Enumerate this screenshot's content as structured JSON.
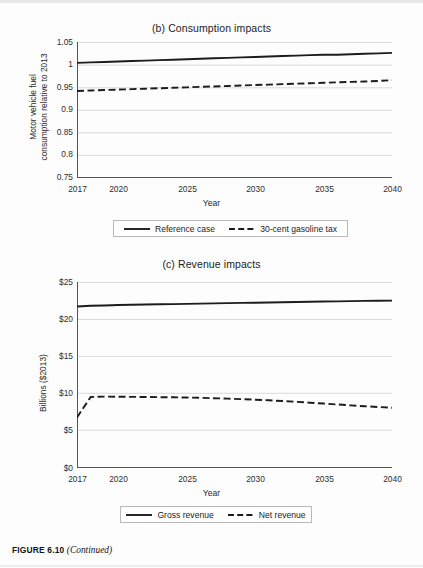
{
  "caption": {
    "figure_number": "FIGURE 6.10",
    "continued": "(Continued)"
  },
  "panel_b": {
    "title": "(b) Consumption impacts",
    "ylabel_line1": "Motor vehicle fuel",
    "ylabel_line2": "consumption relative to 2013",
    "xlabel": "Year",
    "ytick_labels": [
      "1.05",
      "1",
      "0.95",
      "0.9",
      "0.85",
      "0.8",
      "0.75"
    ],
    "xtick_labels": [
      "2017",
      "2020",
      "2025",
      "2030",
      "2035",
      "2040"
    ],
    "legend": [
      {
        "label": "Reference case",
        "style": "solid"
      },
      {
        "label": "30-cent gasoline tax",
        "style": "dashed"
      }
    ]
  },
  "panel_c": {
    "title": "(c) Revenue impacts",
    "ylabel_line1": "Billions ($2013)",
    "xlabel": "Year",
    "ytick_labels": [
      "$25",
      "$20",
      "$15",
      "$10",
      "$5",
      "$0"
    ],
    "xtick_labels": [
      "2017",
      "2020",
      "2025",
      "2030",
      "2035",
      "2040"
    ],
    "legend": [
      {
        "label": "Gross revenue",
        "style": "solid"
      },
      {
        "label": "Net revenue",
        "style": "dashed"
      }
    ]
  },
  "colors": {
    "line": "#1c1c1c",
    "grid": "#d2d2d2",
    "axis": "#4a4a4a",
    "text": "#222222"
  },
  "chart_data": [
    {
      "type": "line",
      "id": "panel-b",
      "title": "(b) Consumption impacts",
      "xlabel": "Year",
      "ylabel": "Motor vehicle fuel consumption relative to 2013",
      "xlim": [
        2017,
        2040
      ],
      "ylim": [
        0.75,
        1.05
      ],
      "yticks": [
        0.75,
        0.8,
        0.85,
        0.9,
        0.95,
        1.0,
        1.05
      ],
      "xticks": [
        2017,
        2020,
        2025,
        2030,
        2035,
        2040
      ],
      "xtick_minor_step": 1,
      "grid": "horizontal",
      "legend_position": "below",
      "x": [
        2017,
        2018,
        2019,
        2020,
        2021,
        2022,
        2023,
        2024,
        2025,
        2026,
        2027,
        2028,
        2029,
        2030,
        2031,
        2032,
        2033,
        2034,
        2035,
        2036,
        2037,
        2038,
        2039,
        2040
      ],
      "series": [
        {
          "name": "Reference case",
          "style": "solid",
          "values": [
            1.004,
            1.005,
            1.006,
            1.007,
            1.008,
            1.009,
            1.01,
            1.011,
            1.012,
            1.013,
            1.014,
            1.015,
            1.016,
            1.017,
            1.018,
            1.019,
            1.02,
            1.021,
            1.022,
            1.022,
            1.023,
            1.024,
            1.025,
            1.026
          ]
        },
        {
          "name": "30-cent gasoline tax",
          "style": "dashed",
          "values": [
            0.942,
            0.943,
            0.944,
            0.945,
            0.946,
            0.947,
            0.948,
            0.949,
            0.95,
            0.951,
            0.952,
            0.953,
            0.954,
            0.955,
            0.956,
            0.957,
            0.958,
            0.959,
            0.96,
            0.961,
            0.962,
            0.963,
            0.964,
            0.966
          ]
        }
      ]
    },
    {
      "type": "line",
      "id": "panel-c",
      "title": "(c) Revenue impacts",
      "xlabel": "Year",
      "ylabel": "Billions ($2013)",
      "xlim": [
        2017,
        2040
      ],
      "ylim": [
        0,
        25
      ],
      "yticks": [
        0,
        5,
        10,
        15,
        20,
        25
      ],
      "xticks": [
        2017,
        2020,
        2025,
        2030,
        2035,
        2040
      ],
      "xtick_minor_step": 1,
      "grid": "horizontal",
      "legend_position": "below",
      "x": [
        2017,
        2018,
        2019,
        2020,
        2021,
        2022,
        2023,
        2024,
        2025,
        2026,
        2027,
        2028,
        2029,
        2030,
        2031,
        2032,
        2033,
        2034,
        2035,
        2036,
        2037,
        2038,
        2039,
        2040
      ],
      "series": [
        {
          "name": "Gross revenue",
          "style": "solid",
          "values": [
            21.7,
            21.8,
            21.85,
            21.9,
            21.95,
            21.98,
            22.0,
            22.03,
            22.06,
            22.1,
            22.13,
            22.16,
            22.19,
            22.22,
            22.25,
            22.28,
            22.31,
            22.34,
            22.37,
            22.4,
            22.43,
            22.46,
            22.48,
            22.5
          ]
        },
        {
          "name": "Net revenue",
          "style": "dashed",
          "values": [
            6.8,
            9.55,
            9.6,
            9.58,
            9.56,
            9.54,
            9.52,
            9.5,
            9.47,
            9.43,
            9.38,
            9.32,
            9.25,
            9.18,
            9.1,
            9.0,
            8.9,
            8.78,
            8.66,
            8.54,
            8.42,
            8.3,
            8.2,
            8.1
          ]
        }
      ]
    }
  ]
}
